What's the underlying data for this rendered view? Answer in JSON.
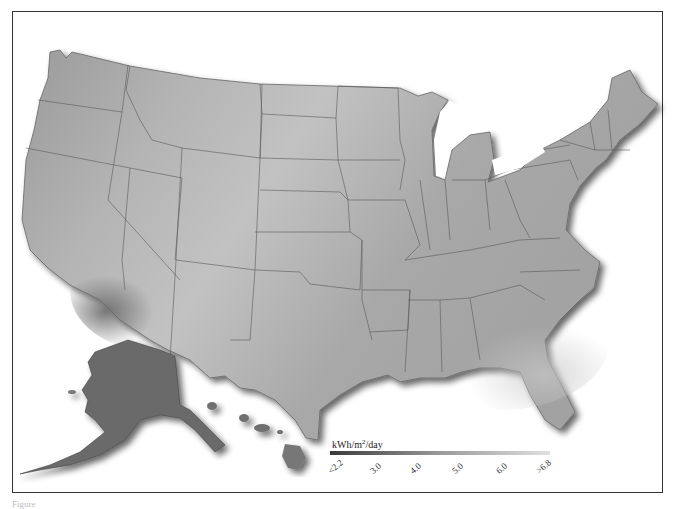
{
  "map": {
    "subject": "Solar radiation, United States (grayscale)",
    "regions": [
      "Contiguous United States",
      "Alaska",
      "Hawaii"
    ],
    "colors": {
      "low": "#3a3a3a",
      "mid": "#8f8f8f",
      "high": "#d8d8d8",
      "border": "#555555",
      "frame": "#333333"
    }
  },
  "legend": {
    "unit_prefix": "kWh/m",
    "unit_sup": "2",
    "unit_suffix": "/day",
    "ticks": [
      "<2.2",
      "3.0",
      "4.0",
      "5.0",
      "6.0",
      ">6.8"
    ]
  },
  "caption": {
    "text": "Figure"
  }
}
